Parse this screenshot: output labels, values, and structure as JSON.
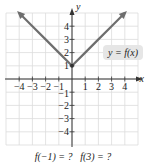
{
  "chart_data": {
    "type": "line",
    "title": "",
    "function_label": "y = f(x)",
    "xlabel": "x",
    "ylabel": "y",
    "xlim": [
      -5,
      5
    ],
    "ylim": [
      -5,
      5
    ],
    "grid": true,
    "x_ticks": [
      -4,
      -3,
      -2,
      -1,
      1,
      2,
      3,
      4
    ],
    "y_ticks": [
      -4,
      -3,
      -2,
      -1,
      1,
      2,
      3,
      4
    ],
    "y_tick_labels_shown": [
      "4",
      "3",
      "2",
      "1",
      "-1",
      "-2",
      "-3",
      "-4"
    ],
    "series": [
      {
        "name": "y = f(x)",
        "description": "V-shaped absolute value graph, f(x) = |x| + 1, arrows on both ends",
        "x": [
          -4,
          -3,
          -2,
          -1,
          0,
          1,
          2,
          3,
          4
        ],
        "y": [
          5,
          4,
          3,
          2,
          1,
          2,
          3,
          4,
          5
        ],
        "color": "#6e6e6e"
      }
    ],
    "vertex": [
      0,
      1
    ]
  },
  "labels": {
    "function": "y = f(x)",
    "x_axis": "x",
    "y_axis": "y",
    "x_tick_labels": [
      "−4",
      "−3",
      "−2",
      "−1",
      "1",
      "2",
      "3",
      "4"
    ],
    "y_tick_labels": [
      "4",
      "3",
      "2",
      "1",
      "−1",
      "−2",
      "−3",
      "−4"
    ]
  },
  "question": {
    "text": "f(−1) = ?   f(3) = ?",
    "part1": "f(−1) = ?",
    "part2": "f(3) = ?"
  },
  "colors": {
    "grid": "#dcdcdc",
    "axis": "#333333",
    "curve": "#6e6e6e",
    "label_box": "#e6e6e6",
    "text": "#222222"
  }
}
